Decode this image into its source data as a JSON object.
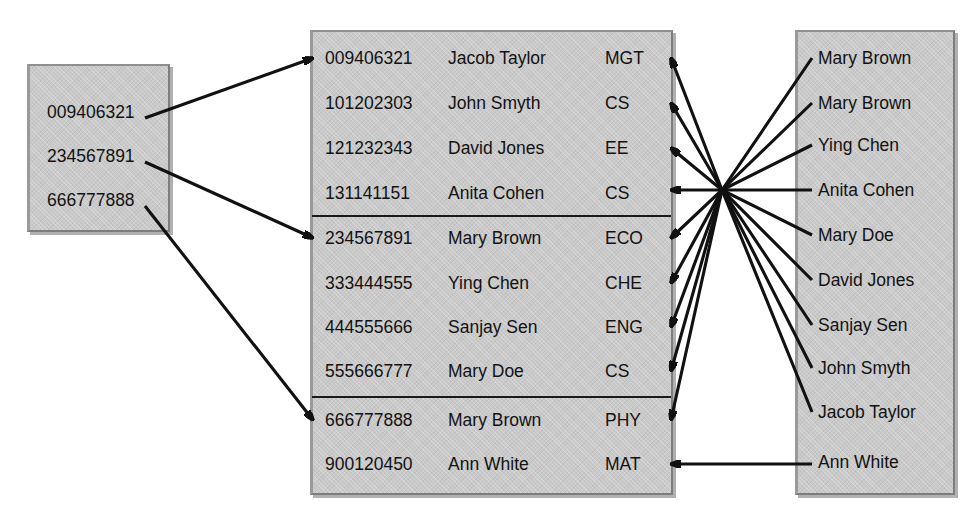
{
  "diagram": {
    "box_fill_color": "#c9c9c9",
    "arrow_color": "#111111",
    "text_color": "#121212"
  },
  "left_box": {
    "name": "student-id-list",
    "items": [
      {
        "value": "009406321"
      },
      {
        "value": "234567891"
      },
      {
        "value": "666777888"
      }
    ]
  },
  "center_table": {
    "name": "student-records-table",
    "groups": [
      {
        "rows": [
          {
            "id": "009406321",
            "name": "Jacob Taylor",
            "dept": "MGT"
          },
          {
            "id": "101202303",
            "name": "John Smyth",
            "dept": "CS"
          },
          {
            "id": "121232343",
            "name": "David Jones",
            "dept": "EE"
          },
          {
            "id": "131141151",
            "name": "Anita Cohen",
            "dept": "CS"
          }
        ]
      },
      {
        "rows": [
          {
            "id": "234567891",
            "name": "Mary Brown",
            "dept": "ECO"
          },
          {
            "id": "333444555",
            "name": "Ying Chen",
            "dept": "CHE"
          },
          {
            "id": "444555666",
            "name": "Sanjay Sen",
            "dept": "ENG"
          },
          {
            "id": "555666777",
            "name": "Mary Doe",
            "dept": "CS"
          }
        ]
      },
      {
        "rows": [
          {
            "id": "666777888",
            "name": "Mary Brown",
            "dept": "PHY"
          },
          {
            "id": "900120450",
            "name": "Ann White",
            "dept": "MAT"
          }
        ]
      }
    ]
  },
  "right_box": {
    "name": "student-name-index",
    "items": [
      {
        "value": "Mary Brown"
      },
      {
        "value": "Mary Brown"
      },
      {
        "value": "Ying Chen"
      },
      {
        "value": "Anita Cohen"
      },
      {
        "value": "Mary Doe"
      },
      {
        "value": "David Jones"
      },
      {
        "value": "Sanjay Sen"
      },
      {
        "value": "John Smyth"
      },
      {
        "value": "Jacob Taylor"
      },
      {
        "value": "Ann White"
      }
    ]
  },
  "connections": {
    "from_left": [
      {
        "from": "009406321",
        "to": "009406321"
      },
      {
        "from": "234567891",
        "to": "234567891"
      },
      {
        "from": "666777888",
        "to": "666777888"
      }
    ],
    "from_right": [
      {
        "from": "Mary Brown",
        "to": "234567891"
      },
      {
        "from": "Mary Brown",
        "to": "666777888"
      },
      {
        "from": "Ying Chen",
        "to": "333444555"
      },
      {
        "from": "Anita Cohen",
        "to": "131141151"
      },
      {
        "from": "Mary Doe",
        "to": "555666777"
      },
      {
        "from": "David Jones",
        "to": "121232343"
      },
      {
        "from": "Sanjay Sen",
        "to": "444555666"
      },
      {
        "from": "John Smyth",
        "to": "101202303"
      },
      {
        "from": "Jacob Taylor",
        "to": "009406321"
      },
      {
        "from": "Ann White",
        "to": "900120450"
      }
    ]
  }
}
